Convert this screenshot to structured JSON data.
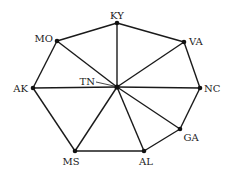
{
  "diagram": {
    "type": "graph",
    "center_node": "TN",
    "nodes": [
      {
        "id": "KY",
        "label": "KY",
        "x": 117,
        "y": 23,
        "label_x": 117,
        "label_y": 19,
        "anchor": "middle"
      },
      {
        "id": "VA",
        "label": "VA",
        "x": 184,
        "y": 42,
        "label_x": 189,
        "label_y": 45,
        "anchor": "start"
      },
      {
        "id": "NC",
        "label": "NC",
        "x": 200,
        "y": 88,
        "label_x": 204,
        "label_y": 92,
        "anchor": "start"
      },
      {
        "id": "GA",
        "label": "GA",
        "x": 180,
        "y": 129,
        "label_x": 191,
        "label_y": 141,
        "anchor": "middle"
      },
      {
        "id": "AL",
        "label": "AL",
        "x": 144,
        "y": 151,
        "label_x": 146,
        "label_y": 165,
        "anchor": "middle"
      },
      {
        "id": "MS",
        "label": "MS",
        "x": 75,
        "y": 151,
        "label_x": 71,
        "label_y": 165,
        "anchor": "middle"
      },
      {
        "id": "AK",
        "label": "AK",
        "x": 33,
        "y": 88,
        "label_x": 28,
        "label_y": 92,
        "anchor": "end"
      },
      {
        "id": "MO",
        "label": "MO",
        "x": 57,
        "y": 41,
        "label_x": 53,
        "label_y": 42,
        "anchor": "end"
      },
      {
        "id": "TN",
        "label": "TN",
        "x": 117,
        "y": 87,
        "label_x": 95,
        "label_y": 85,
        "anchor": "end"
      }
    ],
    "edges": [
      [
        "MO",
        "KY"
      ],
      [
        "KY",
        "VA"
      ],
      [
        "VA",
        "NC"
      ],
      [
        "NC",
        "GA"
      ],
      [
        "GA",
        "AL"
      ],
      [
        "AL",
        "MS"
      ],
      [
        "MS",
        "AK"
      ],
      [
        "AK",
        "MO"
      ],
      [
        "TN",
        "KY"
      ],
      [
        "TN",
        "VA"
      ],
      [
        "TN",
        "NC"
      ],
      [
        "TN",
        "GA"
      ],
      [
        "TN",
        "AL"
      ],
      [
        "TN",
        "MS"
      ],
      [
        "TN",
        "AK"
      ],
      [
        "TN",
        "MO"
      ]
    ],
    "tn_leader": {
      "x1": 96,
      "y1": 82,
      "x2": 114,
      "y2": 86
    },
    "colors": {
      "stroke": "#1a1a1a",
      "node": "#111111",
      "text": "#222222",
      "background": "#ffffff"
    }
  }
}
